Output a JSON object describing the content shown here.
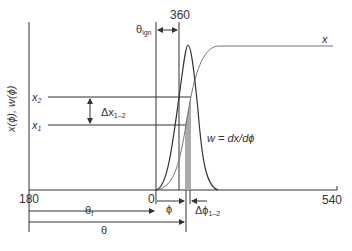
{
  "labels": {
    "theta_ign": "θ",
    "theta_ign_sub": "ign",
    "tdc": "360",
    "curve_x": "x",
    "y_axis": "x(ϕ), w(ϕ)",
    "x2": "x",
    "x2_sub": "2",
    "x1": "x",
    "x1_sub": "1",
    "delta_x": "Δx",
    "delta_x_sub": "1–2",
    "w_eq": "w = dx/dϕ",
    "x_min": "180",
    "zero": "0",
    "x_max": "540",
    "phi": "ϕ",
    "delta_phi": "Δϕ",
    "delta_phi_sub": "1–2",
    "theta_f": "θ",
    "theta_f_sub": "f",
    "theta": "θ"
  },
  "colors": {
    "line": "#333333",
    "grey_curve": "#777777",
    "shade": "#aaaaaa"
  }
}
